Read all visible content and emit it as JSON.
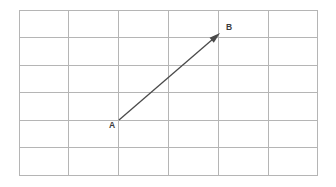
{
  "figure": {
    "background_color": "#ffffff",
    "width": 336,
    "height": 187
  },
  "grid": {
    "columns": 6,
    "rows": 6,
    "line_color": "#b5b5b5",
    "line_width": 1,
    "origin_x": 19,
    "origin_y": 10,
    "cell_width": 49.8,
    "cell_height": 27.5,
    "x_positions": [
      19,
      68.8,
      118.6,
      168.4,
      218.2,
      268,
      317.8
    ],
    "y_positions": [
      10,
      37.5,
      65,
      92.5,
      120,
      147.5,
      175
    ]
  },
  "vector": {
    "color": "#4a4a4a",
    "line_width": 1.3,
    "arrowhead": "solid-triangle",
    "arrowhead_length": 11,
    "arrowhead_width": 6.5,
    "start_point": {
      "label": "A",
      "x": 119,
      "y": 120,
      "grid_col": 2,
      "grid_row": 4
    },
    "end_point": {
      "label": "B",
      "x": 220,
      "y": 33,
      "grid_col": 4,
      "grid_row": 1
    },
    "components": {
      "dx": 2,
      "dy": -3
    }
  },
  "labels": {
    "a": {
      "text": "A",
      "x": 109,
      "y": 128,
      "color": "#3c3c3c"
    },
    "b": {
      "text": "B",
      "x": 226,
      "y": 30,
      "color": "#3c3c3c"
    }
  }
}
